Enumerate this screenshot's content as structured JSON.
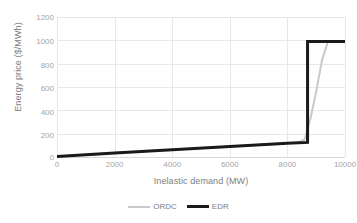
{
  "chart_data": {
    "type": "line",
    "title": "",
    "xlabel": "Inelastic demand (MW)",
    "ylabel": "Energy price ($/MWh)",
    "xlim": [
      0,
      10000
    ],
    "ylim": [
      0,
      1200
    ],
    "xticks": [
      0,
      2000,
      4000,
      6000,
      8000,
      10000
    ],
    "yticks": [
      0,
      200,
      400,
      600,
      800,
      1000,
      1200
    ],
    "xticklabels": [
      "0",
      "2000",
      "4000",
      "6000",
      "8000",
      "10000"
    ],
    "yticklabels": [
      "0",
      "200",
      "400",
      "600",
      "800",
      "1000",
      "1200"
    ],
    "grid": true,
    "grid_color": "#e8e8e8",
    "legend_position": "bottom",
    "series": [
      {
        "name": "ORDC",
        "color": "#c9c9c9",
        "width": 2,
        "x": [
          0,
          2000,
          4000,
          6000,
          8000,
          8400,
          8600,
          8800,
          9000,
          9200,
          9400,
          10000
        ],
        "y": [
          5,
          35,
          62,
          90,
          118,
          128,
          150,
          330,
          560,
          830,
          985,
          990
        ]
      },
      {
        "name": "EDR",
        "color": "#1a1a1a",
        "width": 3,
        "x": [
          0,
          2000,
          4000,
          6000,
          8000,
          8700,
          8700,
          10000
        ],
        "y": [
          5,
          35,
          62,
          90,
          118,
          125,
          990,
          990
        ]
      }
    ]
  },
  "legend": {
    "items": [
      {
        "label": "ORDC"
      },
      {
        "label": "EDR"
      }
    ]
  }
}
